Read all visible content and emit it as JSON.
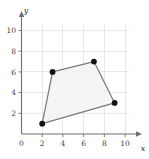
{
  "chart_data": {
    "type": "scatter",
    "title": "",
    "xlabel": "x",
    "ylabel": "y",
    "xlim": [
      0,
      11
    ],
    "ylim": [
      0,
      11
    ],
    "grid": true,
    "legend": false,
    "xticks": [
      0,
      2,
      4,
      6,
      8,
      10
    ],
    "xtick_labels": [
      "0",
      "2",
      "4",
      "6",
      "8",
      "10"
    ],
    "yticks": [
      2,
      4,
      6,
      8,
      10
    ],
    "ytick_labels": [
      "2",
      "4",
      "6",
      "8",
      "10"
    ],
    "series": [
      {
        "name": "quadrilateral",
        "shape": "closed-polygon",
        "marker": "filled-circle",
        "marker_color": "#111111",
        "edge_color": "#7a7a7a",
        "fill_color": "#f3f3f3",
        "points": [
          {
            "x": 2,
            "y": 1
          },
          {
            "x": 3,
            "y": 6
          },
          {
            "x": 7,
            "y": 7
          },
          {
            "x": 9,
            "y": 3
          }
        ]
      }
    ]
  },
  "axes": {
    "x_axis_label": "x",
    "y_axis_label": "y"
  }
}
